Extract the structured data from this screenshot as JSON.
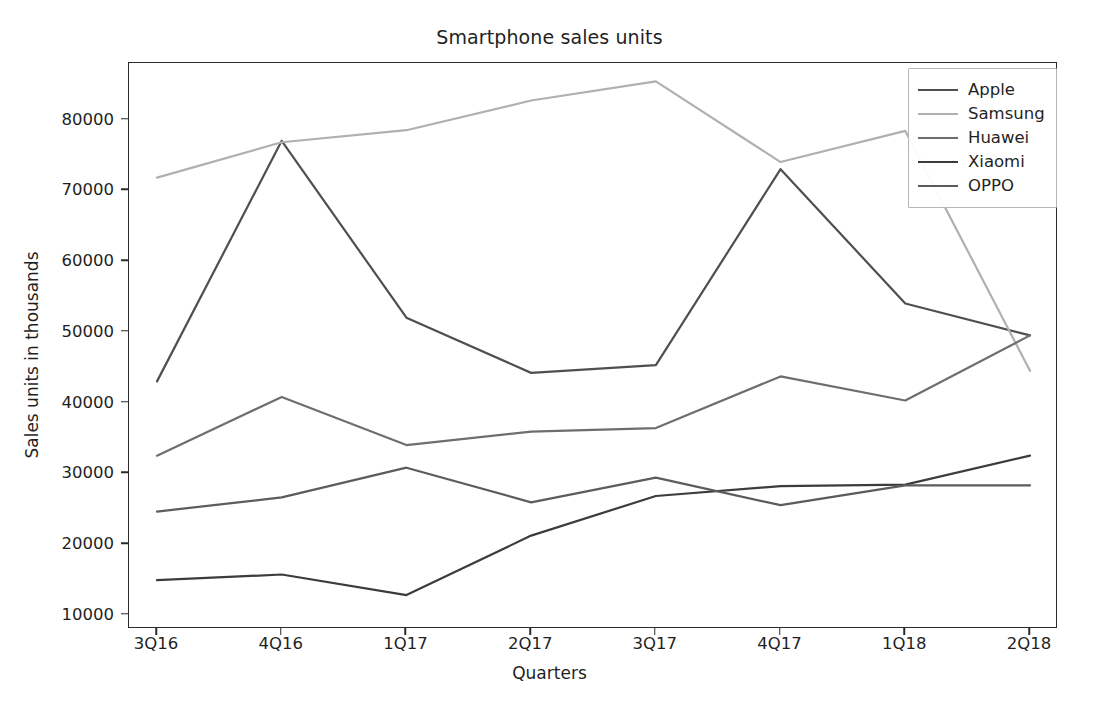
{
  "chart_data": {
    "type": "line",
    "title": "Smartphone sales units",
    "xlabel": "Quarters",
    "ylabel": "Sales units in thousands",
    "categories": [
      "3Q16",
      "4Q16",
      "1Q17",
      "2Q17",
      "3Q17",
      "4Q17",
      "1Q18",
      "2Q18"
    ],
    "ylim": [
      8000,
      88000
    ],
    "yticks": [
      10000,
      20000,
      30000,
      40000,
      50000,
      60000,
      70000,
      80000
    ],
    "ytick_labels": [
      "10000",
      "20000",
      "30000",
      "40000",
      "50000",
      "60000",
      "70000",
      "80000"
    ],
    "grid": false,
    "legend_position": "upper right",
    "series": [
      {
        "name": "Apple",
        "color": "#4f4f4f",
        "values": [
          43000,
          77000,
          52000,
          44200,
          45300,
          73000,
          54000,
          49500
        ]
      },
      {
        "name": "Samsung",
        "color": "#b0b0b0",
        "values": [
          71800,
          76800,
          78500,
          82700,
          85400,
          74000,
          78400,
          44500
        ]
      },
      {
        "name": "Huawei",
        "color": "#6e6e6e",
        "values": [
          32500,
          40800,
          34000,
          35900,
          36400,
          43700,
          40300,
          49500
        ]
      },
      {
        "name": "Xiaomi",
        "color": "#3c3c3c",
        "values": [
          14900,
          15700,
          12800,
          21200,
          26800,
          28200,
          28400,
          32500
        ]
      },
      {
        "name": "OPPO",
        "color": "#5c5c5c",
        "values": [
          24600,
          26600,
          30800,
          25900,
          29400,
          25500,
          28300,
          28300
        ]
      }
    ]
  },
  "legend": {
    "items": [
      {
        "label": "Apple"
      },
      {
        "label": "Samsung"
      },
      {
        "label": "Huawei"
      },
      {
        "label": "Xiaomi"
      },
      {
        "label": "OPPO"
      }
    ]
  }
}
